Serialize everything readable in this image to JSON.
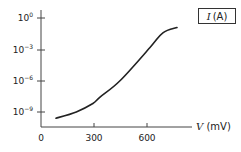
{
  "chart_data": {
    "type": "line",
    "title": "",
    "xlabel": "V (mV)",
    "ylabel": "I (A)",
    "x_symbol": "V",
    "x_unit": "(mV)",
    "y_symbol": "I",
    "y_unit": "(A)",
    "y_scale": "log",
    "xlim": [
      0,
      850
    ],
    "ylim_log10": [
      -11,
      0.5
    ],
    "x_ticks": [
      0,
      300,
      600
    ],
    "x_tick_labels": [
      "0",
      "300",
      "600"
    ],
    "y_ticks_log10": [
      0,
      -3,
      -6,
      -9
    ],
    "y_tick_labels": [
      "10^0",
      "10^-3",
      "10^-6",
      "10^-9"
    ],
    "grid": false,
    "legend_position": "top-right (axis label box)",
    "series": [
      {
        "name": "I",
        "x": [
          85,
          200,
          294,
          334,
          450,
          617,
          690,
          770
        ],
        "log10_y": [
          -9.5,
          -8.9,
          -8.1,
          -7.5,
          -5.9,
          -2.8,
          -1.4,
          -0.9
        ]
      }
    ]
  }
}
